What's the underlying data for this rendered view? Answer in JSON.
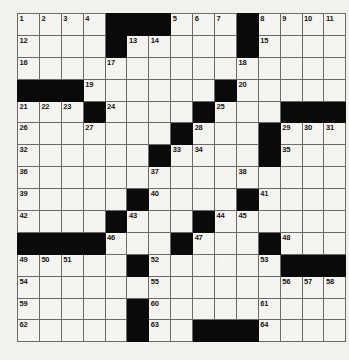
{
  "puzzle": {
    "title": "Crossword Grid",
    "rows": 15,
    "cols": 15,
    "block_color": "#0a0a0a",
    "cell_color": "#f5f4f1",
    "grid_line_color": "#6b6b6b",
    "background_color": "#f2f1ee",
    "grid": [
      [
        {
          "type": "white",
          "num": "1"
        },
        {
          "type": "white",
          "num": "2"
        },
        {
          "type": "white",
          "num": "3"
        },
        {
          "type": "white",
          "num": "4"
        },
        {
          "type": "block",
          "num": ""
        },
        {
          "type": "block",
          "num": ""
        },
        {
          "type": "block",
          "num": ""
        },
        {
          "type": "white",
          "num": "5"
        },
        {
          "type": "white",
          "num": "6"
        },
        {
          "type": "white",
          "num": "7"
        },
        {
          "type": "block",
          "num": ""
        },
        {
          "type": "white",
          "num": "8"
        },
        {
          "type": "white",
          "num": "9"
        },
        {
          "type": "white",
          "num": "10"
        },
        {
          "type": "white",
          "num": "11"
        }
      ],
      [
        {
          "type": "white",
          "num": "12"
        },
        {
          "type": "white",
          "num": ""
        },
        {
          "type": "white",
          "num": ""
        },
        {
          "type": "white",
          "num": ""
        },
        {
          "type": "block",
          "num": ""
        },
        {
          "type": "white",
          "num": "13"
        },
        {
          "type": "white",
          "num": "14"
        },
        {
          "type": "white",
          "num": ""
        },
        {
          "type": "white",
          "num": ""
        },
        {
          "type": "white",
          "num": ""
        },
        {
          "type": "block",
          "num": ""
        },
        {
          "type": "white",
          "num": "15"
        },
        {
          "type": "white",
          "num": ""
        },
        {
          "type": "white",
          "num": ""
        },
        {
          "type": "white",
          "num": ""
        }
      ],
      [
        {
          "type": "white",
          "num": "16"
        },
        {
          "type": "white",
          "num": ""
        },
        {
          "type": "white",
          "num": ""
        },
        {
          "type": "white",
          "num": ""
        },
        {
          "type": "white",
          "num": "17"
        },
        {
          "type": "white",
          "num": ""
        },
        {
          "type": "white",
          "num": ""
        },
        {
          "type": "white",
          "num": ""
        },
        {
          "type": "white",
          "num": ""
        },
        {
          "type": "white",
          "num": ""
        },
        {
          "type": "white",
          "num": "18"
        },
        {
          "type": "white",
          "num": ""
        },
        {
          "type": "white",
          "num": ""
        },
        {
          "type": "white",
          "num": ""
        },
        {
          "type": "white",
          "num": ""
        }
      ],
      [
        {
          "type": "block",
          "num": ""
        },
        {
          "type": "block",
          "num": ""
        },
        {
          "type": "block",
          "num": ""
        },
        {
          "type": "white",
          "num": "19"
        },
        {
          "type": "white",
          "num": ""
        },
        {
          "type": "white",
          "num": ""
        },
        {
          "type": "white",
          "num": ""
        },
        {
          "type": "white",
          "num": ""
        },
        {
          "type": "white",
          "num": ""
        },
        {
          "type": "block",
          "num": ""
        },
        {
          "type": "white",
          "num": "20"
        },
        {
          "type": "white",
          "num": ""
        },
        {
          "type": "white",
          "num": ""
        },
        {
          "type": "white",
          "num": ""
        },
        {
          "type": "white",
          "num": ""
        }
      ],
      [
        {
          "type": "white",
          "num": "21"
        },
        {
          "type": "white",
          "num": "22"
        },
        {
          "type": "white",
          "num": "23"
        },
        {
          "type": "block",
          "num": ""
        },
        {
          "type": "white",
          "num": "24"
        },
        {
          "type": "white",
          "num": ""
        },
        {
          "type": "white",
          "num": ""
        },
        {
          "type": "white",
          "num": ""
        },
        {
          "type": "block",
          "num": ""
        },
        {
          "type": "white",
          "num": "25"
        },
        {
          "type": "white",
          "num": ""
        },
        {
          "type": "white",
          "num": ""
        },
        {
          "type": "block",
          "num": ""
        },
        {
          "type": "block",
          "num": ""
        },
        {
          "type": "block",
          "num": ""
        }
      ],
      [
        {
          "type": "white",
          "num": "26"
        },
        {
          "type": "white",
          "num": ""
        },
        {
          "type": "white",
          "num": ""
        },
        {
          "type": "white",
          "num": "27"
        },
        {
          "type": "white",
          "num": ""
        },
        {
          "type": "white",
          "num": ""
        },
        {
          "type": "white",
          "num": ""
        },
        {
          "type": "block",
          "num": ""
        },
        {
          "type": "white",
          "num": "28"
        },
        {
          "type": "white",
          "num": ""
        },
        {
          "type": "white",
          "num": ""
        },
        {
          "type": "block",
          "num": ""
        },
        {
          "type": "white",
          "num": "29"
        },
        {
          "type": "white",
          "num": "30"
        },
        {
          "type": "white",
          "num": "31"
        }
      ],
      [
        {
          "type": "white",
          "num": "32"
        },
        {
          "type": "white",
          "num": ""
        },
        {
          "type": "white",
          "num": ""
        },
        {
          "type": "white",
          "num": ""
        },
        {
          "type": "white",
          "num": ""
        },
        {
          "type": "white",
          "num": ""
        },
        {
          "type": "block",
          "num": ""
        },
        {
          "type": "white",
          "num": "33"
        },
        {
          "type": "white",
          "num": "34"
        },
        {
          "type": "white",
          "num": ""
        },
        {
          "type": "white",
          "num": ""
        },
        {
          "type": "block",
          "num": ""
        },
        {
          "type": "white",
          "num": "35"
        },
        {
          "type": "white",
          "num": ""
        },
        {
          "type": "white",
          "num": ""
        }
      ],
      [
        {
          "type": "white",
          "num": "36"
        },
        {
          "type": "white",
          "num": ""
        },
        {
          "type": "white",
          "num": ""
        },
        {
          "type": "white",
          "num": ""
        },
        {
          "type": "white",
          "num": ""
        },
        {
          "type": "white",
          "num": ""
        },
        {
          "type": "white",
          "num": "37"
        },
        {
          "type": "white",
          "num": ""
        },
        {
          "type": "white",
          "num": ""
        },
        {
          "type": "white",
          "num": ""
        },
        {
          "type": "white",
          "num": "38"
        },
        {
          "type": "white",
          "num": ""
        },
        {
          "type": "white",
          "num": ""
        },
        {
          "type": "white",
          "num": ""
        },
        {
          "type": "white",
          "num": ""
        }
      ],
      [
        {
          "type": "white",
          "num": "39"
        },
        {
          "type": "white",
          "num": ""
        },
        {
          "type": "white",
          "num": ""
        },
        {
          "type": "white",
          "num": ""
        },
        {
          "type": "white",
          "num": ""
        },
        {
          "type": "block",
          "num": ""
        },
        {
          "type": "white",
          "num": "40"
        },
        {
          "type": "white",
          "num": ""
        },
        {
          "type": "white",
          "num": ""
        },
        {
          "type": "white",
          "num": ""
        },
        {
          "type": "block",
          "num": ""
        },
        {
          "type": "white",
          "num": "41"
        },
        {
          "type": "white",
          "num": ""
        },
        {
          "type": "white",
          "num": ""
        },
        {
          "type": "white",
          "num": ""
        }
      ],
      [
        {
          "type": "white",
          "num": "42"
        },
        {
          "type": "white",
          "num": ""
        },
        {
          "type": "white",
          "num": ""
        },
        {
          "type": "white",
          "num": ""
        },
        {
          "type": "block",
          "num": ""
        },
        {
          "type": "white",
          "num": "43"
        },
        {
          "type": "white",
          "num": ""
        },
        {
          "type": "white",
          "num": ""
        },
        {
          "type": "block",
          "num": ""
        },
        {
          "type": "white",
          "num": "44"
        },
        {
          "type": "white",
          "num": "45"
        },
        {
          "type": "white",
          "num": ""
        },
        {
          "type": "white",
          "num": ""
        },
        {
          "type": "white",
          "num": ""
        },
        {
          "type": "white",
          "num": ""
        }
      ],
      [
        {
          "type": "block",
          "num": ""
        },
        {
          "type": "block",
          "num": ""
        },
        {
          "type": "block",
          "num": ""
        },
        {
          "type": "block",
          "num": ""
        },
        {
          "type": "white",
          "num": "46"
        },
        {
          "type": "white",
          "num": ""
        },
        {
          "type": "white",
          "num": ""
        },
        {
          "type": "block",
          "num": ""
        },
        {
          "type": "white",
          "num": "47"
        },
        {
          "type": "white",
          "num": ""
        },
        {
          "type": "white",
          "num": ""
        },
        {
          "type": "block",
          "num": ""
        },
        {
          "type": "white",
          "num": "48"
        },
        {
          "type": "white",
          "num": ""
        },
        {
          "type": "white",
          "num": ""
        }
      ],
      [
        {
          "type": "white",
          "num": "49"
        },
        {
          "type": "white",
          "num": "50"
        },
        {
          "type": "white",
          "num": "51"
        },
        {
          "type": "white",
          "num": ""
        },
        {
          "type": "white",
          "num": ""
        },
        {
          "type": "block",
          "num": ""
        },
        {
          "type": "white",
          "num": "52"
        },
        {
          "type": "white",
          "num": ""
        },
        {
          "type": "white",
          "num": ""
        },
        {
          "type": "white",
          "num": ""
        },
        {
          "type": "white",
          "num": ""
        },
        {
          "type": "white",
          "num": "53"
        },
        {
          "type": "block",
          "num": ""
        },
        {
          "type": "block",
          "num": ""
        },
        {
          "type": "block",
          "num": ""
        }
      ],
      [
        {
          "type": "white",
          "num": "54"
        },
        {
          "type": "white",
          "num": ""
        },
        {
          "type": "white",
          "num": ""
        },
        {
          "type": "white",
          "num": ""
        },
        {
          "type": "white",
          "num": ""
        },
        {
          "type": "white",
          "num": ""
        },
        {
          "type": "white",
          "num": "55"
        },
        {
          "type": "white",
          "num": ""
        },
        {
          "type": "white",
          "num": ""
        },
        {
          "type": "white",
          "num": ""
        },
        {
          "type": "white",
          "num": ""
        },
        {
          "type": "white",
          "num": ""
        },
        {
          "type": "white",
          "num": "56"
        },
        {
          "type": "white",
          "num": "57"
        },
        {
          "type": "white",
          "num": "58"
        }
      ],
      [
        {
          "type": "white",
          "num": "59"
        },
        {
          "type": "white",
          "num": ""
        },
        {
          "type": "white",
          "num": ""
        },
        {
          "type": "white",
          "num": ""
        },
        {
          "type": "white",
          "num": ""
        },
        {
          "type": "block",
          "num": ""
        },
        {
          "type": "white",
          "num": "60"
        },
        {
          "type": "white",
          "num": ""
        },
        {
          "type": "white",
          "num": ""
        },
        {
          "type": "white",
          "num": ""
        },
        {
          "type": "white",
          "num": ""
        },
        {
          "type": "white",
          "num": "61"
        },
        {
          "type": "white",
          "num": ""
        },
        {
          "type": "white",
          "num": ""
        },
        {
          "type": "white",
          "num": ""
        }
      ],
      [
        {
          "type": "white",
          "num": "62"
        },
        {
          "type": "white",
          "num": ""
        },
        {
          "type": "white",
          "num": ""
        },
        {
          "type": "white",
          "num": ""
        },
        {
          "type": "white",
          "num": ""
        },
        {
          "type": "block",
          "num": ""
        },
        {
          "type": "white",
          "num": "63"
        },
        {
          "type": "white",
          "num": ""
        },
        {
          "type": "block",
          "num": ""
        },
        {
          "type": "block",
          "num": ""
        },
        {
          "type": "block",
          "num": ""
        },
        {
          "type": "white",
          "num": "64"
        },
        {
          "type": "white",
          "num": ""
        },
        {
          "type": "white",
          "num": ""
        },
        {
          "type": "white",
          "num": ""
        }
      ]
    ]
  }
}
